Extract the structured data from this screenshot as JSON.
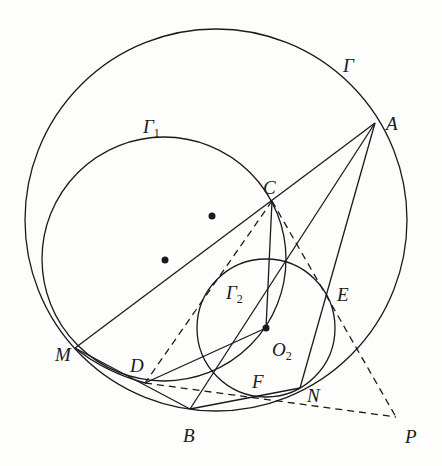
{
  "figure": {
    "type": "geometry",
    "stroke_color": "#1a1a1a",
    "background": "#fdfdfc",
    "circles": [
      {
        "name": "Gamma",
        "cx": 216,
        "cy": 220,
        "r": 191
      },
      {
        "name": "Gamma1",
        "cx": 164,
        "cy": 259,
        "r": 122
      },
      {
        "name": "Gamma2",
        "cx": 266,
        "cy": 328,
        "r": 69
      }
    ],
    "points": {
      "A": [
        375,
        123
      ],
      "C": [
        272,
        201
      ],
      "M": [
        75,
        348
      ],
      "D": [
        145,
        383
      ],
      "B": [
        190,
        409
      ],
      "F": [
        260,
        398
      ],
      "N": [
        300,
        388
      ],
      "E": [
        333,
        298
      ],
      "P": [
        396,
        417
      ],
      "O2": [
        266,
        328
      ]
    },
    "dots": [
      [
        212,
        216
      ],
      [
        165,
        260
      ],
      [
        266,
        328
      ]
    ]
  },
  "labels": {
    "gamma": {
      "base": "Γ",
      "sub": ""
    },
    "gamma1": {
      "base": "Γ",
      "sub": "1"
    },
    "gamma2": {
      "base": "Γ",
      "sub": "2"
    },
    "A": "A",
    "C": "C",
    "E": "E",
    "M": "M",
    "D": "D",
    "O2": {
      "base": "O",
      "sub": "2"
    },
    "F": "F",
    "N": "N",
    "B": "B",
    "P": "P"
  }
}
